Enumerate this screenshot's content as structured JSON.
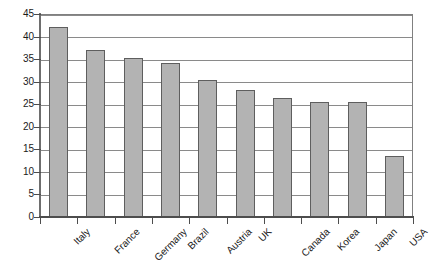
{
  "chart_data": {
    "type": "bar",
    "title": "",
    "subtitle": "",
    "xlabel": "",
    "ylabel": "",
    "categories": [
      "Italy",
      "France",
      "Germany",
      "Brazil",
      "Austria",
      "UK",
      "Canada",
      "Korea",
      "Japan",
      "USA"
    ],
    "values": [
      42.2,
      37.1,
      35.2,
      34.2,
      30.3,
      28.2,
      26.4,
      25.4,
      25.4,
      13.6
    ],
    "series": [
      {
        "name": "",
        "values": [
          42.2,
          37.1,
          35.2,
          34.2,
          30.3,
          28.2,
          26.4,
          25.4,
          25.4,
          13.6
        ]
      }
    ],
    "ylim": [
      0,
      45
    ],
    "yticks": [
      0,
      5,
      10,
      15,
      20,
      25,
      30,
      35,
      40,
      45
    ],
    "ytick_labels": [
      "0",
      "5",
      "10",
      "15",
      "20",
      "25",
      "30",
      "35",
      "40",
      "45"
    ],
    "grid": "horizontal",
    "legend": "none",
    "bar_color": "#b3b3b3",
    "bar_border_color": "#5e5e5e",
    "gridline_color": "#8a8a8a",
    "axis_color": "#4d4d4d",
    "plot_background": "#ffffff",
    "xtick_label_rotation": -45,
    "annotations": []
  }
}
